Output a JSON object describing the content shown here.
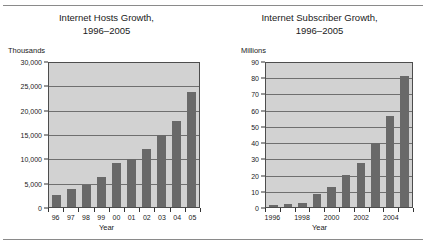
{
  "figure": {
    "background": "#ffffff",
    "rule_color": "#8a8a8a",
    "plot_bg": "#d2d2d2",
    "bar_color": "#696969",
    "grid_color": "#6f6f6f",
    "axis_color": "#4d4d4d"
  },
  "chart_data": [
    {
      "type": "bar",
      "title": "Internet Hosts Growth,",
      "subtitle": "1996–2005",
      "ylabel": "Thousands",
      "xlabel": "Year",
      "categories": [
        "96",
        "97",
        "98",
        "99",
        "00",
        "01",
        "02",
        "03",
        "04",
        "05"
      ],
      "values": [
        2400,
        3800,
        4500,
        6200,
        9000,
        9900,
        12000,
        14900,
        17700,
        23600
      ],
      "ylim": [
        0,
        30000
      ],
      "yticks": [
        0,
        5000,
        10000,
        15000,
        20000,
        25000,
        30000
      ],
      "ytick_labels": [
        "0",
        "5,000",
        "10,000",
        "15,000",
        "20,000",
        "25,000",
        "30,000"
      ],
      "xtick_labels": [
        "96",
        "97",
        "98",
        "99",
        "00",
        "01",
        "02",
        "03",
        "04",
        "05"
      ],
      "grid": true,
      "legend": "none"
    },
    {
      "type": "bar",
      "title": "Internet Subscriber Growth,",
      "subtitle": "1996–2005",
      "ylabel": "Millions",
      "xlabel": "Year",
      "categories": [
        "1996",
        "1997",
        "1998",
        "1999",
        "2000",
        "2001",
        "2002",
        "2003",
        "2004",
        "2005"
      ],
      "values": [
        1.0,
        1.8,
        2.5,
        8.2,
        12.5,
        19.5,
        27.0,
        39.5,
        56.0,
        81.0
      ],
      "ylim": [
        0,
        90
      ],
      "yticks": [
        0,
        10,
        20,
        30,
        40,
        50,
        60,
        70,
        80,
        90
      ],
      "ytick_labels": [
        "0",
        "10",
        "20",
        "30",
        "40",
        "50",
        "60",
        "70",
        "80",
        "90"
      ],
      "xtick_labels": [
        "1996",
        "",
        "1998",
        "",
        "2000",
        "",
        "2002",
        "",
        "2004",
        ""
      ],
      "grid": true,
      "legend": "none"
    }
  ]
}
